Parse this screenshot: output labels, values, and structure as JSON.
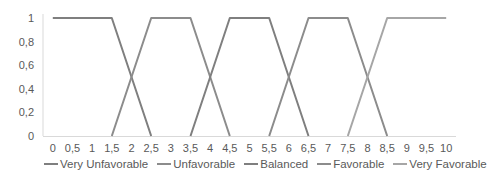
{
  "chart_data": {
    "type": "line",
    "title": "",
    "xlabel": "",
    "ylabel": "",
    "x": [
      "0",
      "0,5",
      "1",
      "1,5",
      "2",
      "2,5",
      "3",
      "3,5",
      "4",
      "4,5",
      "5",
      "5,5",
      "6",
      "6,5",
      "7",
      "7,5",
      "8",
      "8,5",
      "9",
      "9,5",
      "10"
    ],
    "yticks": [
      "1",
      "0,8",
      "0,6",
      "0,4",
      "0,2",
      "0"
    ],
    "ylim": [
      0,
      1
    ],
    "grid": false,
    "legend_position": "bottom",
    "series": [
      {
        "name": "Very Unfavorable",
        "color": "#7f7f7f",
        "values": [
          1,
          1,
          1,
          1,
          0.5,
          0,
          null,
          null,
          null,
          null,
          null,
          null,
          null,
          null,
          null,
          null,
          null,
          null,
          null,
          null,
          null
        ]
      },
      {
        "name": "Unfavorable",
        "color": "#8c8c8c",
        "values": [
          null,
          null,
          null,
          0,
          0.5,
          1,
          1,
          1,
          0.5,
          0,
          null,
          null,
          null,
          null,
          null,
          null,
          null,
          null,
          null,
          null,
          null
        ]
      },
      {
        "name": "Balanced",
        "color": "#7f7f7f",
        "values": [
          null,
          null,
          null,
          null,
          null,
          null,
          null,
          0,
          0.5,
          1,
          1,
          1,
          0.5,
          0,
          null,
          null,
          null,
          null,
          null,
          null,
          null
        ]
      },
      {
        "name": "Favorable",
        "color": "#8c8c8c",
        "values": [
          null,
          null,
          null,
          null,
          null,
          null,
          null,
          null,
          null,
          null,
          null,
          0,
          0.5,
          1,
          1,
          1,
          0.5,
          0,
          null,
          null,
          null
        ]
      },
      {
        "name": "Very Favorable",
        "color": "#a6a6a6",
        "values": [
          null,
          null,
          null,
          null,
          null,
          null,
          null,
          null,
          null,
          null,
          null,
          null,
          null,
          null,
          null,
          0,
          0.5,
          1,
          1,
          1,
          1
        ]
      }
    ]
  }
}
